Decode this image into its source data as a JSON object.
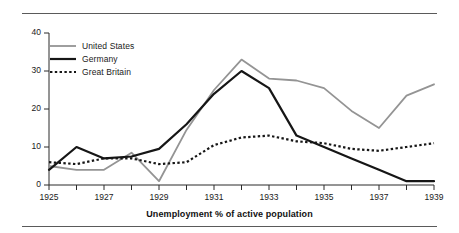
{
  "figure": {
    "caption": "Unemployment % of active population"
  },
  "legend": {
    "items": [
      {
        "label": "United States",
        "color": "#949494",
        "style": "solid",
        "width": 1.8
      },
      {
        "label": "Germany",
        "color": "#161616",
        "style": "solid",
        "width": 2.2
      },
      {
        "label": "Great Britain",
        "color": "#161616",
        "style": "dotted",
        "width": 2.2
      }
    ]
  },
  "axes": {
    "y_ticks": [
      "0",
      "10",
      "20",
      "30",
      "40"
    ],
    "x_ticks": [
      "1925",
      "1927",
      "1929",
      "1931",
      "1933",
      "1935",
      "1937",
      "1939"
    ],
    "x_minor_years": [
      "1926",
      "1928",
      "1930",
      "1932",
      "1934",
      "1936",
      "1938"
    ]
  },
  "chart_data": {
    "type": "line",
    "title": "Unemployment % of active population",
    "xlabel": "",
    "ylabel": "",
    "xlim": [
      1925,
      1939
    ],
    "ylim": [
      0,
      40
    ],
    "ytick_step": 10,
    "grid": false,
    "legend_position": "upper-left-inside",
    "x": [
      1925,
      1926,
      1927,
      1928,
      1929,
      1930,
      1931,
      1932,
      1933,
      1934,
      1935,
      1936,
      1937,
      1938,
      1939
    ],
    "series": [
      {
        "name": "United States",
        "color": "#949494",
        "style": "solid",
        "values": [
          5.0,
          4.0,
          4.0,
          8.5,
          1.0,
          14.5,
          25.0,
          33.0,
          28.0,
          27.5,
          25.5,
          19.5,
          15.0,
          23.5,
          26.5
        ]
      },
      {
        "name": "Germany",
        "color": "#161616",
        "style": "solid",
        "values": [
          4.0,
          10.0,
          7.0,
          7.5,
          9.5,
          16.0,
          24.0,
          30.0,
          25.5,
          13.0,
          10.0,
          7.0,
          4.0,
          1.0,
          1.0
        ]
      },
      {
        "name": "Great Britain",
        "color": "#161616",
        "style": "dotted",
        "values": [
          6.0,
          5.5,
          7.0,
          7.0,
          5.5,
          6.0,
          10.5,
          12.5,
          13.0,
          11.5,
          11.0,
          9.5,
          9.0,
          10.0,
          11.0
        ]
      }
    ]
  }
}
